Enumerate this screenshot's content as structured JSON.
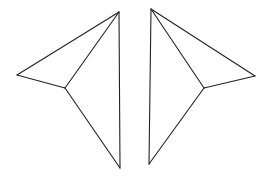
{
  "canvas": {
    "width": 272,
    "height": 180,
    "background": "#ffffff",
    "stroke": "#222222"
  },
  "figures": [
    {
      "name": "left-kite",
      "vertices": {
        "top": [
          119,
          12
        ],
        "outer": [
          17,
          75
        ],
        "inner": [
          65,
          88
        ],
        "bottom": [
          120,
          168
        ]
      },
      "edges": [
        [
          "top",
          "outer"
        ],
        [
          "outer",
          "inner"
        ],
        [
          "inner",
          "top"
        ],
        [
          "inner",
          "bottom"
        ],
        [
          "top",
          "bottom"
        ]
      ]
    },
    {
      "name": "right-kite",
      "vertices": {
        "top": [
          151,
          9
        ],
        "outer": [
          255,
          76
        ],
        "inner": [
          204,
          88
        ],
        "bottom": [
          149,
          164
        ]
      },
      "edges": [
        [
          "top",
          "outer"
        ],
        [
          "outer",
          "inner"
        ],
        [
          "inner",
          "top"
        ],
        [
          "inner",
          "bottom"
        ],
        [
          "top",
          "bottom"
        ]
      ]
    }
  ]
}
